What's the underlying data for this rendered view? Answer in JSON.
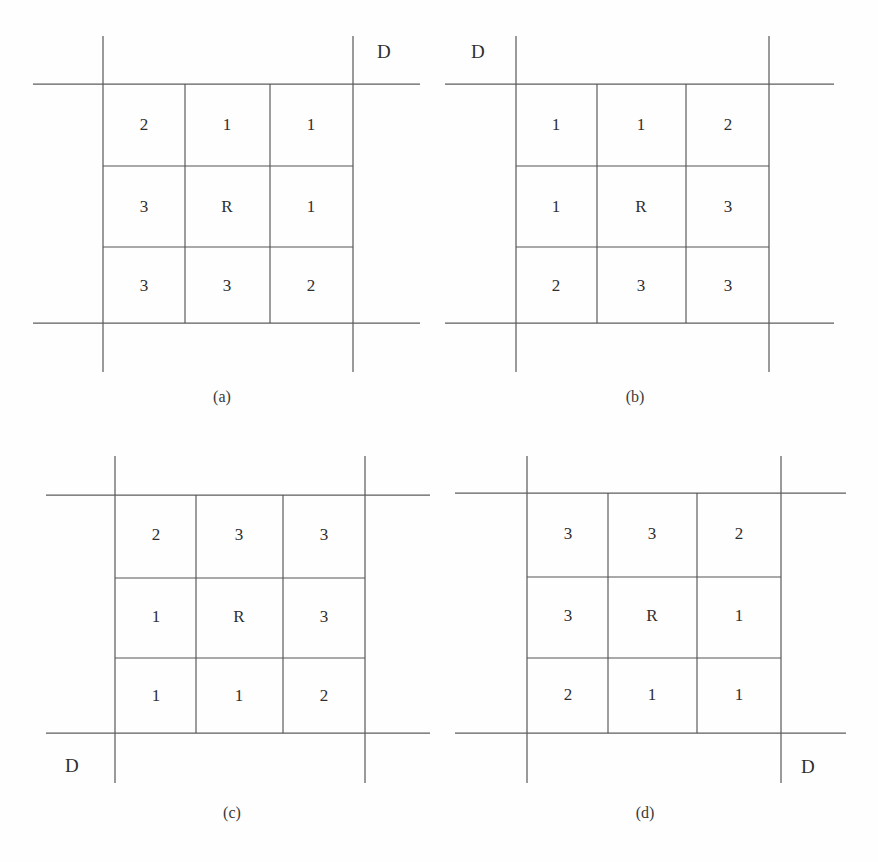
{
  "figure": {
    "background_color": "#fefefe",
    "line_color": "#555555",
    "text_color": "#2e2e2e",
    "panel_count": 4
  },
  "panels": [
    {
      "id": "a",
      "caption": "(a)",
      "direction_label": "D",
      "direction_corner": "top-right",
      "center_label": "R",
      "grid": [
        [
          "2",
          "1",
          "1"
        ],
        [
          "3",
          "R",
          "1"
        ],
        [
          "3",
          "3",
          "2"
        ]
      ]
    },
    {
      "id": "b",
      "caption": "(b)",
      "direction_label": "D",
      "direction_corner": "top-left",
      "center_label": "R",
      "grid": [
        [
          "1",
          "1",
          "2"
        ],
        [
          "1",
          "R",
          "3"
        ],
        [
          "2",
          "3",
          "3"
        ]
      ]
    },
    {
      "id": "c",
      "caption": "(c)",
      "direction_label": "D",
      "direction_corner": "bottom-left",
      "center_label": "R",
      "grid": [
        [
          "2",
          "3",
          "3"
        ],
        [
          "1",
          "R",
          "3"
        ],
        [
          "1",
          "1",
          "2"
        ]
      ]
    },
    {
      "id": "d",
      "caption": "(d)",
      "direction_label": "D",
      "direction_corner": "bottom-right",
      "center_label": "R",
      "grid": [
        [
          "3",
          "3",
          "2"
        ],
        [
          "3",
          "R",
          "1"
        ],
        [
          "2",
          "1",
          "1"
        ]
      ]
    }
  ]
}
